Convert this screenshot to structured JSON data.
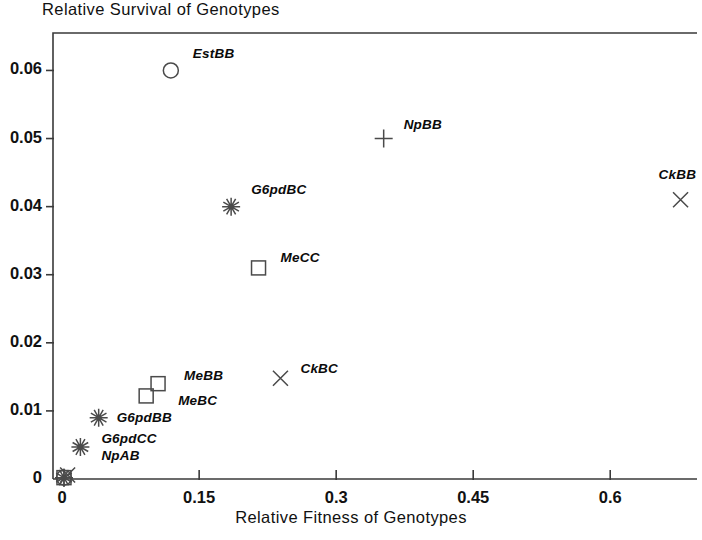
{
  "chart_data": {
    "type": "scatter",
    "title": "Relative Survival of Genotypes",
    "xlabel": "Relative Fitness of Genotypes",
    "ylabel": "",
    "xlim": [
      -0.01,
      0.695
    ],
    "ylim": [
      0,
      0.0655
    ],
    "grid": false,
    "legend": "none",
    "xticks": [
      0,
      0.15,
      0.3,
      0.45,
      0.6
    ],
    "xticklabels": [
      "0",
      "0.15",
      "0.3",
      "0.45",
      "0.6"
    ],
    "yticks": [
      0,
      0.01,
      0.02,
      0.03,
      0.04,
      0.05,
      0.06
    ],
    "yticklabels": [
      "0",
      "0.01",
      "0.02",
      "0.03",
      "0.04",
      "0.05",
      "0.06"
    ],
    "points": [
      {
        "label": "EstBB",
        "x": 0.119,
        "y": 0.06,
        "marker": "circle",
        "label_dx": 22,
        "label_dy": -16
      },
      {
        "label": "NpBB",
        "x": 0.352,
        "y": 0.05,
        "marker": "plus",
        "label_dx": 20,
        "label_dy": -14
      },
      {
        "label": "CkBB",
        "x": 0.677,
        "y": 0.041,
        "marker": "cross",
        "label_dx": -22,
        "label_dy": -25
      },
      {
        "label": "G6pdBC",
        "x": 0.185,
        "y": 0.04,
        "marker": "asterisk",
        "label_dx": 20,
        "label_dy": -17
      },
      {
        "label": "MeCC",
        "x": 0.215,
        "y": 0.031,
        "marker": "square",
        "label_dx": 22,
        "label_dy": -10
      },
      {
        "label": "MeBB",
        "x": 0.105,
        "y": 0.014,
        "marker": "square",
        "label_dx": 26,
        "label_dy": -8
      },
      {
        "label": "MeBC",
        "x": 0.092,
        "y": 0.0122,
        "marker": "square",
        "label_dx": 32,
        "label_dy": 5
      },
      {
        "label": "CkBC",
        "x": 0.239,
        "y": 0.0148,
        "marker": "cross",
        "label_dx": 20,
        "label_dy": -9
      },
      {
        "label": "G6pdBB",
        "x": 0.04,
        "y": 0.009,
        "marker": "asterisk",
        "label_dx": 18,
        "label_dy": 0
      },
      {
        "label": "G6pdCC",
        "x": 0.02,
        "y": 0.0047,
        "marker": "asterisk",
        "label_dx": 21,
        "label_dy": -8
      },
      {
        "label": "NpAB",
        "x": 0.02,
        "y": 0.0047,
        "marker": "none",
        "label_dx": 21,
        "label_dy": 9
      },
      {
        "label": "",
        "x": 0.002,
        "y": 0.0002,
        "marker": "circle",
        "label_dx": 0,
        "label_dy": 0
      },
      {
        "label": "",
        "x": 0.002,
        "y": 0.0002,
        "marker": "asterisk",
        "label_dx": 0,
        "label_dy": 0
      },
      {
        "label": "",
        "x": 0.002,
        "y": 0.0002,
        "marker": "square",
        "label_dx": 0,
        "label_dy": 0
      },
      {
        "label": "",
        "x": 0.006,
        "y": 0.0006,
        "marker": "cross",
        "label_dx": 0,
        "label_dy": 0
      },
      {
        "label": "",
        "x": 0.002,
        "y": 0.0002,
        "marker": "plus",
        "label_dx": 0,
        "label_dy": 0
      }
    ],
    "axis_color": "#3a3a3a",
    "marker_color": "#4a4a4a"
  }
}
